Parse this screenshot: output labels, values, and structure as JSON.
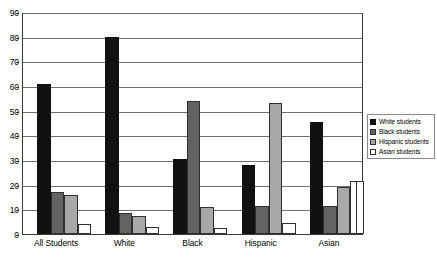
{
  "chart_data": {
    "type": "bar",
    "title": "",
    "subtitle": "",
    "xlabel": "",
    "ylabel": "",
    "ylim": [
      0,
      90
    ],
    "ytick_step": 10,
    "yticks": [
      90,
      80,
      70,
      60,
      50,
      40,
      30,
      20,
      10,
      0
    ],
    "grid": true,
    "legend_position": "right",
    "categories": [
      "All Students",
      "White",
      "Black",
      "Hispanic",
      "Asian"
    ],
    "series": [
      {
        "name": "White  students",
        "color": "#111111",
        "values": [
          61,
          80,
          30.5,
          28,
          45.5
        ]
      },
      {
        "name": "Black students",
        "color": "#636363",
        "values": [
          17,
          8.5,
          54,
          11.5,
          11.5
        ]
      },
      {
        "name": "Hispanic students",
        "color": "#a8a8a8",
        "values": [
          16,
          7.5,
          11,
          53,
          19
        ]
      },
      {
        "name": "Asian students",
        "color": "#ffffff",
        "values": [
          4,
          2.7,
          2.4,
          4.3,
          21.5
        ]
      }
    ]
  },
  "legend": {
    "items": [
      {
        "label": "White  students",
        "swatch": "legend-swatch-black"
      },
      {
        "label": "Black students",
        "swatch": "legend-swatch-dark-gray"
      },
      {
        "label": "Hispanic students",
        "swatch": "legend-swatch-light-gray"
      },
      {
        "label": "Asian students",
        "swatch": "legend-swatch-white"
      }
    ]
  },
  "axes": {
    "y_tick_labels": [
      "90",
      "80",
      "70",
      "60",
      "50",
      "40",
      "30",
      "20",
      "10",
      "0"
    ],
    "x_tick_labels": [
      "All Students",
      "White",
      "Black",
      "Hispanic",
      "Asian"
    ]
  },
  "colors": {
    "series_1": "#111111",
    "series_2": "#636363",
    "series_3": "#a8a8a8",
    "series_4": "#ffffff",
    "gridline": "#6f6f6f",
    "axis": "#3a3a3a",
    "background": "#ffffff"
  }
}
